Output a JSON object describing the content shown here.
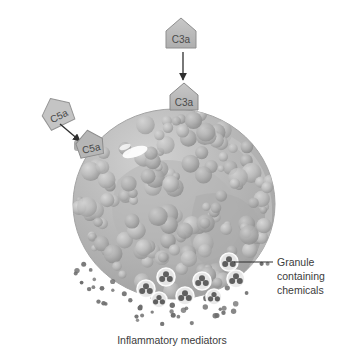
{
  "figure": {
    "background_color": "#ffffff"
  },
  "ligands": {
    "free": [
      {
        "id": "c3a-free",
        "label": "C3a",
        "shape": "pentagon",
        "x": 181,
        "y": 33,
        "size": 30,
        "rotation": 0,
        "fill": "#b9b9b9",
        "stroke": "#8f8f8f"
      },
      {
        "id": "c5a-free",
        "label": "C5a",
        "shape": "pentagon",
        "x": 57,
        "y": 112,
        "size": 30,
        "rotation": -28,
        "fill": "#c4c4c4",
        "stroke": "#959595"
      }
    ],
    "bound": [
      {
        "id": "c3a-bound",
        "label": "C3a",
        "shape": "pentagon",
        "x": 188,
        "y": 97,
        "size": 27,
        "rotation": 0,
        "fill": "#b2b2b2",
        "stroke": "#8a8a8a"
      },
      {
        "id": "c5a-bound",
        "label": "C5a",
        "shape": "pentagon",
        "x": 90,
        "y": 143,
        "size": 26,
        "rotation": -14,
        "fill": "#b6b6b6",
        "stroke": "#8c8c8c"
      }
    ]
  },
  "arrows": [
    {
      "id": "c3a-binding-arrow",
      "from_x": 183,
      "from_y": 52,
      "to_x": 183,
      "to_y": 80,
      "color": "#2f2f2f"
    },
    {
      "id": "c5a-binding-arrow",
      "from_x": 62,
      "from_y": 126,
      "to_x": 80,
      "to_y": 141,
      "color": "#2f2f2f"
    }
  ],
  "cell": {
    "name": "mast-cell",
    "center_x": 174,
    "center_y": 204,
    "radius_x": 101,
    "radius_y": 95,
    "fill": "#b4b4b4",
    "stroke": "#9b9b9b",
    "highlight": {
      "x": 135,
      "y": 152,
      "rx": 13,
      "ry": 5,
      "color": "#ffffff"
    }
  },
  "annotations": {
    "granule_label": {
      "name": "granule-label",
      "lines": [
        "Granule",
        "containing",
        "chemicals"
      ],
      "x": 277,
      "y": 266,
      "leader_from_x": 273,
      "leader_from_y": 262,
      "leader_to_x": 234,
      "leader_to_y": 262,
      "color": "#3b3b3b"
    },
    "caption": {
      "name": "inflammatory-mediators-caption",
      "text": "Inflammatory mediators",
      "x": 172,
      "y": 344,
      "color": "#3b3b3b"
    }
  },
  "granules": [
    {
      "x": 229,
      "y": 262,
      "r": 9
    },
    {
      "x": 166,
      "y": 277,
      "r": 9
    },
    {
      "x": 202,
      "y": 281,
      "r": 9
    },
    {
      "x": 146,
      "y": 289,
      "r": 9
    },
    {
      "x": 236,
      "y": 279,
      "r": 9
    },
    {
      "x": 185,
      "y": 296,
      "r": 9
    },
    {
      "x": 159,
      "y": 300,
      "r": 8
    },
    {
      "x": 214,
      "y": 297,
      "r": 8
    }
  ],
  "mediator_dots": {
    "color": "#6d6d6d",
    "count": 58,
    "radius_range": [
      1.6,
      2.8
    ]
  },
  "internal_spheres": {
    "fill_light": "#c6c6c6",
    "fill_mid": "#b0b0b0",
    "fill_dark": "#9c9c9c",
    "count": 150
  }
}
